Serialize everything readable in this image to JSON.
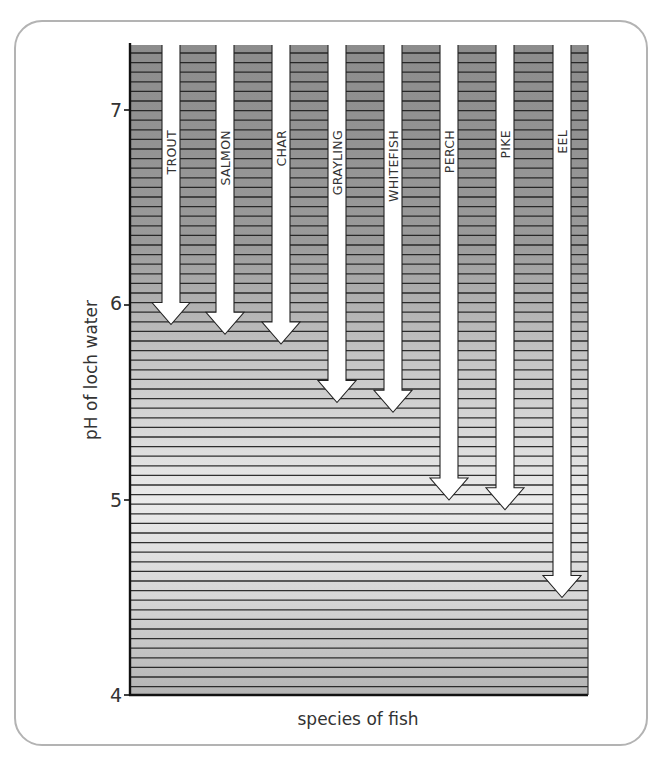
{
  "chart_data": {
    "type": "bar",
    "title": "",
    "xlabel": "species of fish",
    "ylabel": "pH of loch water",
    "ylim": [
      4,
      7.35
    ],
    "yticks": [
      4,
      5,
      6,
      7
    ],
    "grid": false,
    "legend": null,
    "encoding": "downward arrows from top of plot; arrow tip marks minimum pH tolerated by each species",
    "categories": [
      "TROUT",
      "SALMON",
      "CHAR",
      "GRAYLING",
      "WHITEFISH",
      "PERCH",
      "PIKE",
      "EEL"
    ],
    "values": [
      5.9,
      5.85,
      5.8,
      5.5,
      5.45,
      5.0,
      4.95,
      4.5
    ]
  },
  "axis": {
    "y_title": "pH of loch water",
    "x_title": "species of fish",
    "ticks": [
      "7",
      "6",
      "5",
      "4"
    ]
  },
  "species": [
    {
      "label": "TROUT"
    },
    {
      "label": "SALMON"
    },
    {
      "label": "CHAR"
    },
    {
      "label": "GRAYLING"
    },
    {
      "label": "WHITEFISH"
    },
    {
      "label": "PERCH"
    },
    {
      "label": "PIKE"
    },
    {
      "label": "EEL"
    }
  ],
  "colors": {
    "band_dark": "#8a8a8a",
    "band_light": "#e6e6e6",
    "stripe": "#1a1a1a",
    "arrow": "#ffffff",
    "frame": "#b3b3b3"
  }
}
